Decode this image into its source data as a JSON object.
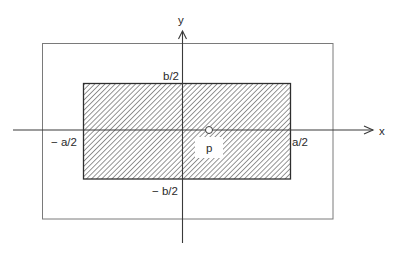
{
  "diagram": {
    "type": "coordinate-diagram",
    "axes": {
      "x_label": "x",
      "y_label": "y"
    },
    "labels": {
      "top": "b/2",
      "bottom": "− b/2",
      "left": "− a/2",
      "right": "a/2",
      "point": "p"
    },
    "colors": {
      "axis": "#3a3a3a",
      "outer_border": "#7a7a7a",
      "inner_border": "#2e2e2e",
      "hatch": "#6a6a6a",
      "background": "#ffffff"
    }
  }
}
